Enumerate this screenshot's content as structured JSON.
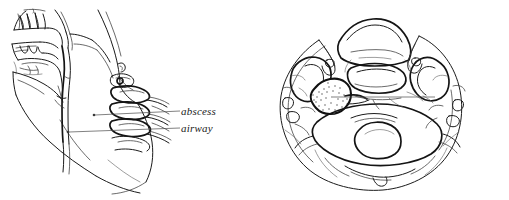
{
  "figure": {
    "name": "retropharyngeal-abscess-illustration",
    "style": "pen-and-ink medical line drawing",
    "background_color": "#ffffff",
    "ink_color": "#1b1b1b",
    "panels": [
      {
        "id": "lateral",
        "name": "lateral-neck-view",
        "description": "sagittal lateral view of head and neck showing nasal cavity, palate, teeth, tongue, airway column and cervical vertebrae"
      },
      {
        "id": "axial",
        "name": "axial-cross-section-view",
        "description": "axial cross-section of the neck showing mandible, airway, vertebral body, spinal canal and a stippled thick-walled abscess cavity"
      }
    ]
  },
  "labels": {
    "abscess": "abscess",
    "airway": "airway",
    "cavity_line_1": "thick-walled",
    "cavity_line_2": "abscess",
    "cavity_line_3": "cavity"
  },
  "annotations": {
    "leader_line_color": "#4a4a4a",
    "marker_dot_color": "#3a3a3a",
    "stipple_color": "#6a6a6a",
    "cavity_wall_color": "#111111"
  }
}
